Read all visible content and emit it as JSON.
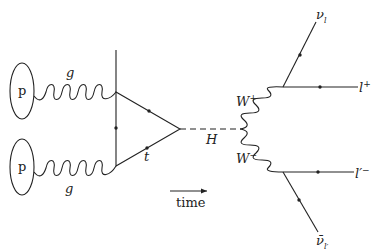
{
  "diagram": {
    "type": "feynman",
    "process": "gluon-gluon fusion Higgs production, H -> W+ W- -> leptons",
    "protons": [
      {
        "label": "p"
      },
      {
        "label": "p"
      }
    ],
    "gluons": [
      {
        "label": "g"
      },
      {
        "label": "g"
      }
    ],
    "loop_quark": {
      "label": "t"
    },
    "higgs": {
      "label": "H"
    },
    "w_plus": {
      "label": "W",
      "charge": "+"
    },
    "w_minus": {
      "label": "W",
      "charge": "−"
    },
    "outgoing": {
      "nu_l": {
        "label": "ν",
        "sub": "l"
      },
      "l_plus": {
        "label": "l",
        "sup": "+"
      },
      "l_prime_minus": {
        "label": "l′",
        "sup": "−"
      },
      "nu_bar_lprime": {
        "label": "ν̄",
        "sub": "l′"
      }
    },
    "time_axis": {
      "label": "time"
    }
  },
  "colors": {
    "line": "#222222",
    "background": "#ffffff"
  }
}
